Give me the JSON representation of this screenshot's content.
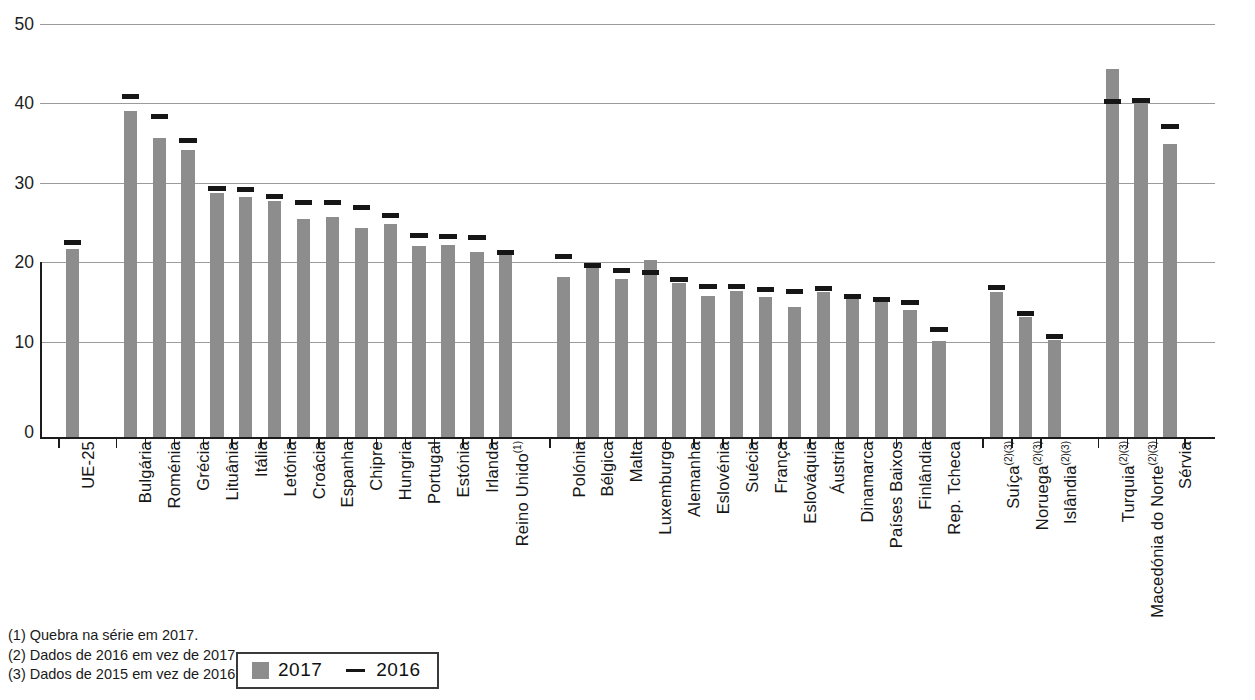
{
  "chart_data": {
    "type": "bar",
    "title": "",
    "subtitle": "",
    "xlabel": "",
    "ylabel": "",
    "ylim": [
      0,
      50
    ],
    "yticks": [
      0,
      10,
      20,
      30,
      40,
      50
    ],
    "grid": true,
    "legend_position": "bottom-left",
    "categories": [
      "UE-25",
      "Bulgária",
      "Roménia",
      "Grécia",
      "Lituânia",
      "Itália",
      "Letónia",
      "Croácia",
      "Espanha",
      "Chipre",
      "Hungria",
      "Portugal",
      "Estónia",
      "Irlanda",
      "Reino Unido",
      "Polónia",
      "Bélgica",
      "Malta",
      "Luxemburgo",
      "Alemanha",
      "Eslovénia",
      "Suécia",
      "França",
      "Eslováquia",
      "Áustria",
      "Dinamarca",
      "Países Baixos",
      "Finlândia",
      "Rep. Tcheca",
      "Suíça",
      "Noruega",
      "Islândia",
      "Turquia",
      "Macedónia do Norte",
      "Sérvia"
    ],
    "category_footnotes": [
      "",
      "",
      "",
      "",
      "",
      "",
      "",
      "",
      "",
      "",
      "",
      "",
      "",
      "",
      "(1)",
      "",
      "",
      "",
      "",
      "",
      "",
      "",
      "",
      "",
      "",
      "",
      "",
      "",
      "",
      "(2)(3)",
      "(2)(3)",
      "(2)(3)",
      "(2)(3)",
      "(2)(3)",
      ""
    ],
    "series": [
      {
        "name": "2017",
        "type": "bar",
        "color": "#8d8d8d",
        "values": [
          22.8,
          39.5,
          36.2,
          34.8,
          29.6,
          29.0,
          28.6,
          26.4,
          26.6,
          25.3,
          25.8,
          23.1,
          23.3,
          22.4,
          22.1,
          19.4,
          20.6,
          19.1,
          21.4,
          18.7,
          17.1,
          17.7,
          16.9,
          15.7,
          17.5,
          16.8,
          16.4,
          15.4,
          11.6,
          17.5,
          14.5,
          11.8,
          44.5,
          40.5,
          35.5
        ]
      },
      {
        "name": "2016",
        "type": "marker",
        "color": "#161616",
        "values": [
          23.5,
          41.2,
          38.8,
          35.8,
          30.0,
          29.9,
          29.1,
          28.3,
          28.3,
          27.7,
          26.8,
          24.3,
          24.2,
          24.1,
          22.3,
          21.8,
          20.7,
          20.1,
          19.8,
          19.0,
          18.1,
          18.1,
          17.8,
          17.6,
          17.9,
          17.0,
          16.6,
          16.2,
          12.9,
          18.0,
          14.9,
          12.1,
          40.6,
          40.7,
          37.5
        ]
      }
    ],
    "group_gaps_after": [
      0,
      14,
      28,
      31
    ]
  },
  "legend": {
    "series_2017_label": "2017",
    "series_2016_label": "2016",
    "swatch_name": "bar-swatch",
    "dash_name": "line-swatch"
  },
  "footnotes": {
    "note1": "(1) Quebra na série em 2017.",
    "note2": "(2) Dados de 2016 em vez de 2017.",
    "note3": "(3) Dados de 2015 em vez de 2016."
  },
  "axis": {
    "y_tick_0": "0",
    "y_tick_10": "10",
    "y_tick_20": "20",
    "y_tick_30": "30",
    "y_tick_40": "40",
    "y_tick_50": "50"
  },
  "colors": {
    "bar": "#8d8d8d",
    "marker": "#161616",
    "grid": "#9b9b9b",
    "axis": "#1c1c1c"
  }
}
